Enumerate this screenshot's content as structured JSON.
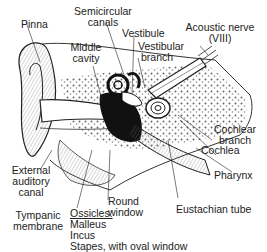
{
  "diagram": {
    "labels": {
      "pinna": "Pinna",
      "semicircular_canals_1": "Semicircular",
      "semicircular_canals_2": "canals",
      "vestibule": "Vestibule",
      "acoustic_nerve_1": "Acoustic nerve",
      "acoustic_nerve_2": "(VIII)",
      "middle_cavity_1": "Middle",
      "middle_cavity_2": "cavity",
      "vestibular_branch_1": "Vestibular",
      "vestibular_branch_2": "branch",
      "cochlear_branch_1": "Cochlear",
      "cochlear_branch_2": "branch",
      "cochlea": "Cochlea",
      "external_canal_1": "External",
      "external_canal_2": "auditory",
      "external_canal_3": "canal",
      "pharynx": "Pharynx",
      "round_window_1": "Round",
      "round_window_2": "window",
      "ossicles_heading": "Ossicles:",
      "malleus": "Malleus",
      "incus": "Incus",
      "stapes": "Stapes, with oval window",
      "tympanic_1": "Tympanic",
      "tympanic_2": "membrane",
      "eustachian_tube": "Eustachian tube"
    },
    "colors": {
      "ink": "#222222",
      "paper": "#ffffff",
      "stipple": "#555555"
    }
  }
}
